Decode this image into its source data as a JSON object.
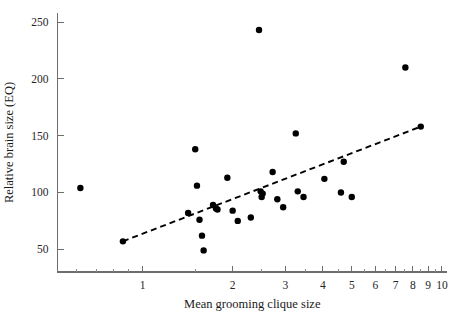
{
  "figure": {
    "background_color": "#ffffff",
    "axis_color": "#6d6d6d",
    "point_color": "#000000",
    "line_color": "#000000"
  },
  "chart_data": {
    "type": "scatter",
    "title": "",
    "subtitle": "",
    "xlabel": "Mean grooming clique size",
    "ylabel": "Relative brain size (EQ)",
    "xscale": "log",
    "yscale": "linear",
    "xlim": [
      0.52,
      10.4
    ],
    "ylim": [
      30,
      258
    ],
    "grid": false,
    "legend": null,
    "x_major_ticks": [
      1,
      2,
      3,
      4,
      5,
      6,
      7,
      8,
      9,
      10
    ],
    "x_major_tick_labels": [
      "1",
      "2",
      "3",
      "4",
      "5",
      "6",
      "7",
      "8",
      "9",
      "10"
    ],
    "x_minor_ticks": [
      0.6,
      0.7,
      0.8,
      0.9,
      1.5,
      2.5,
      3.5,
      4.5,
      5.5,
      6.5,
      7.5,
      8.5,
      9.5
    ],
    "y_major_ticks": [
      50,
      100,
      150,
      200,
      250
    ],
    "y_major_tick_labels": [
      "50",
      "100",
      "150",
      "200",
      "250"
    ],
    "points": [
      {
        "x": 0.62,
        "y": 104
      },
      {
        "x": 0.86,
        "y": 57
      },
      {
        "x": 1.42,
        "y": 82
      },
      {
        "x": 1.5,
        "y": 138
      },
      {
        "x": 1.52,
        "y": 106
      },
      {
        "x": 1.55,
        "y": 76
      },
      {
        "x": 1.58,
        "y": 62
      },
      {
        "x": 1.6,
        "y": 49
      },
      {
        "x": 1.72,
        "y": 89
      },
      {
        "x": 1.76,
        "y": 86
      },
      {
        "x": 1.78,
        "y": 85
      },
      {
        "x": 1.92,
        "y": 113
      },
      {
        "x": 2.0,
        "y": 84
      },
      {
        "x": 2.08,
        "y": 75
      },
      {
        "x": 2.3,
        "y": 78
      },
      {
        "x": 2.45,
        "y": 243
      },
      {
        "x": 2.48,
        "y": 101
      },
      {
        "x": 2.5,
        "y": 96
      },
      {
        "x": 2.52,
        "y": 99
      },
      {
        "x": 2.72,
        "y": 118
      },
      {
        "x": 2.82,
        "y": 94
      },
      {
        "x": 2.95,
        "y": 87
      },
      {
        "x": 3.25,
        "y": 152
      },
      {
        "x": 3.3,
        "y": 101
      },
      {
        "x": 3.45,
        "y": 96
      },
      {
        "x": 4.05,
        "y": 112
      },
      {
        "x": 4.6,
        "y": 100
      },
      {
        "x": 4.7,
        "y": 127
      },
      {
        "x": 5.0,
        "y": 96
      },
      {
        "x": 7.55,
        "y": 210
      },
      {
        "x": 8.5,
        "y": 158
      }
    ],
    "trendline": {
      "style": "dashed",
      "x_start": 0.86,
      "y_start": 57,
      "x_end": 8.5,
      "y_end": 158
    }
  }
}
